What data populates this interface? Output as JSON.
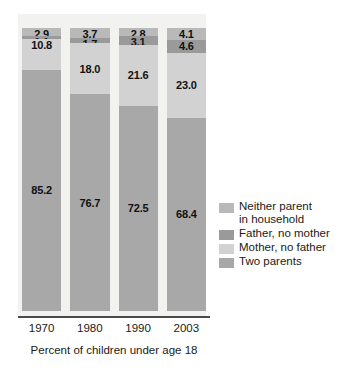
{
  "chart_data": {
    "type": "bar",
    "stacked": true,
    "title": "",
    "subtitle": "",
    "xlabel": "Percent of children under age 18",
    "ylabel": "",
    "ylim": [
      0,
      100
    ],
    "grid": false,
    "legend_position": "right",
    "categories": [
      "1970",
      "1980",
      "1990",
      "2003"
    ],
    "series": [
      {
        "name": "Neither parent in household",
        "color": "#b9b9b9",
        "values": [
          2.9,
          3.7,
          2.8,
          4.1
        ],
        "labels": [
          "2.9",
          "3.7",
          "2.8",
          "4.1"
        ]
      },
      {
        "name": "Father, no mother",
        "color": "#9a9a9a",
        "values": [
          1.1,
          1.7,
          3.1,
          4.6
        ],
        "labels": [
          "1.1",
          "1.7",
          "3.1",
          "4.6"
        ]
      },
      {
        "name": "Mother, no father",
        "color": "#d2d2d2",
        "values": [
          10.8,
          18.0,
          21.6,
          23.0
        ],
        "labels": [
          "10.8",
          "18.0",
          "21.6",
          "23.0"
        ]
      },
      {
        "name": "Two parents",
        "color": "#a8a8a8",
        "values": [
          85.2,
          76.7,
          72.5,
          68.4
        ],
        "labels": [
          "85.2",
          "76.7",
          "72.5",
          "68.4"
        ]
      }
    ]
  },
  "axis": {
    "ticks": [
      "1970",
      "1980",
      "1990",
      "2003"
    ],
    "caption": "Percent of children under age 18"
  },
  "legend": {
    "items": [
      {
        "label": "Neither parent\nin household",
        "color": "#b9b9b9"
      },
      {
        "label": "Father, no mother",
        "color": "#9a9a9a"
      },
      {
        "label": "Mother, no father",
        "color": "#d2d2d2"
      },
      {
        "label": "Two parents",
        "color": "#a8a8a8"
      }
    ]
  },
  "colors": {
    "plot_background": "#f2f2f0",
    "axis_line": "#4a4a4a",
    "text": "#1a1a1a"
  }
}
